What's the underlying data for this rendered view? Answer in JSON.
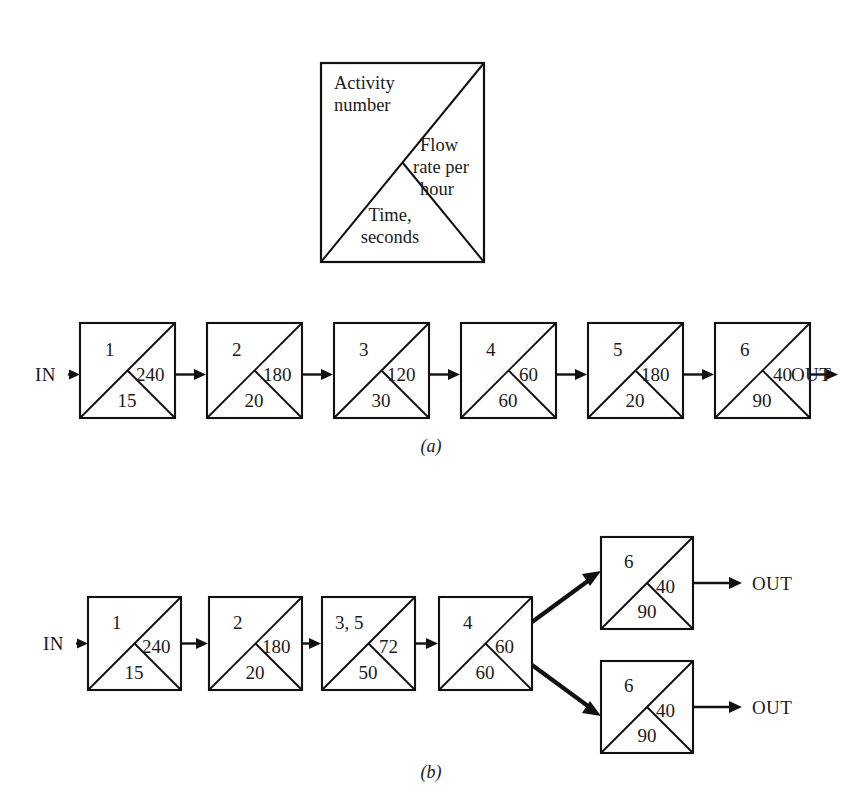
{
  "figure": {
    "caption_a": "(a)",
    "caption_b": "(b)",
    "legend": {
      "title_line1": "Activity",
      "title_line2": "number",
      "flow_line1": "Flow",
      "flow_line2": "rate per",
      "flow_line3": "hour",
      "time_line1": "Time,",
      "time_line2": "seconds"
    },
    "labels": {
      "in": "IN",
      "out": "OUT"
    },
    "colors": {
      "stroke": "#111111",
      "background": "#ffffff",
      "text": "#1a1a1a"
    }
  },
  "diagram_a": {
    "boxes": [
      {
        "activity": "1",
        "flow": "240",
        "time": "15"
      },
      {
        "activity": "2",
        "flow": "180",
        "time": "20"
      },
      {
        "activity": "3",
        "flow": "120",
        "time": "30"
      },
      {
        "activity": "4",
        "flow": "60",
        "time": "60"
      },
      {
        "activity": "5",
        "flow": "180",
        "time": "20"
      },
      {
        "activity": "6",
        "flow": "40",
        "time": "90"
      }
    ],
    "in_label": "IN",
    "out_label": "OUT"
  },
  "diagram_b": {
    "main_boxes": [
      {
        "activity": "1",
        "flow": "240",
        "time": "15"
      },
      {
        "activity": "2",
        "flow": "180",
        "time": "20"
      },
      {
        "activity": "3, 5",
        "flow": "72",
        "time": "50"
      },
      {
        "activity": "4",
        "flow": "60",
        "time": "60"
      }
    ],
    "branch_boxes": [
      {
        "activity": "6",
        "flow": "40",
        "time": "90",
        "out_label": "OUT"
      },
      {
        "activity": "6",
        "flow": "40",
        "time": "90",
        "out_label": "OUT"
      }
    ],
    "in_label": "IN"
  }
}
